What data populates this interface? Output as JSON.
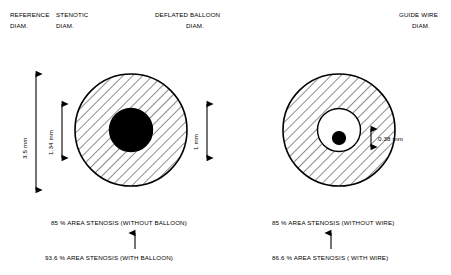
{
  "title_labels": {
    "reference_diam": "REFERENCE\nDIAM.",
    "reference_line1": "REFERENCE",
    "reference_line2": "DIAM.",
    "stenotic_line1": "STENOTIC",
    "stenotic_line2": "DIAM.",
    "deflated_line1": "DEFLATED BALLOON",
    "deflated_line2": "DIAM.",
    "guidewire_line1": "GUIDE WIRE",
    "guidewire_line2": "DIAM."
  },
  "measurements": {
    "reference_diameter": "3.5 mm",
    "stenotic_diameter": "1.34 mm",
    "balloon_diameter": "1 mm",
    "wire_diameter": "0.38 mm"
  },
  "left_panel": {
    "stenosis_without": "85 % AREA STENOSIS (WITHOUT BALLOON)",
    "stenosis_with": "93.6 % AREA STENOSIS (WITH BALLOON)"
  },
  "right_panel": {
    "stenosis_without": "85 % AREA STENOSIS (WITHOUT WIRE)",
    "stenosis_with": "86.6 % AREA STENOSIS ( WITH WIRE)"
  },
  "colors": {
    "stroke": "#000000",
    "fill": "#ffffff",
    "hatch": "#000000"
  }
}
